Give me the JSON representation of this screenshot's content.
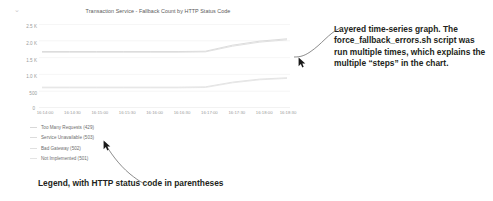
{
  "panel": {
    "corner_glyph": "⌄",
    "title": "Transaction Service - Fallback Count by HTTP Status Code"
  },
  "chart_data": {
    "type": "line",
    "title": "Transaction Service - Fallback Count by HTTP Status Code",
    "xlabel": "",
    "ylabel": "",
    "grid": true,
    "legend_position": "bottom-left",
    "ylim": [
      0,
      2500
    ],
    "ytick_labels": [
      "2.5 K",
      "2.0 K",
      "1.5 K",
      "1.0 K",
      "500",
      "0"
    ],
    "ytick_values": [
      2500,
      2000,
      1500,
      1000,
      500,
      0
    ],
    "x": [
      "16:14:00",
      "16:14:30",
      "16:15:00",
      "16:15:30",
      "16:16:00",
      "16:16:30",
      "16:17:00",
      "16:17:30",
      "16:18:00",
      "16:18:30"
    ],
    "series": [
      {
        "name": "Too Many Requests (429)",
        "status_code": "429",
        "color": "#d8d8d8",
        "values": [
          1680,
          1680,
          1680,
          1680,
          1680,
          1680,
          1690,
          1870,
          1990,
          2060
        ]
      },
      {
        "name": "Service Unavailable (503)",
        "status_code": "503",
        "color": "#dcdcdc",
        "values": [
          1660,
          1660,
          1660,
          1660,
          1660,
          1660,
          1670,
          1840,
          1960,
          2030
        ]
      },
      {
        "name": "Bad Gateway (502)",
        "status_code": "502",
        "color": "#e0e0e0",
        "values": [
          620,
          620,
          620,
          620,
          620,
          620,
          630,
          770,
          860,
          900
        ]
      },
      {
        "name": "Not Implemented (501)",
        "status_code": "501",
        "color": "#e4e4e4",
        "values": [
          600,
          600,
          600,
          600,
          600,
          600,
          610,
          750,
          840,
          880
        ]
      }
    ]
  },
  "legend": {
    "items": [
      {
        "label": "Too Many Requests (429)",
        "color": "#d8d8d8"
      },
      {
        "label": "Service Unavailable (503)",
        "color": "#dcdcdc"
      },
      {
        "label": "Bad Gateway (502)",
        "color": "#e0e0e0"
      },
      {
        "label": "Not Implemented (501)",
        "color": "#e4e4e4"
      }
    ]
  },
  "annotations": {
    "right": "Layered time-series graph. The force_fallback_errors.sh script was run multiple times, which explains the multiple “steps” in the chart.",
    "bottom": "Legend, with HTTP status code in parentheses"
  }
}
